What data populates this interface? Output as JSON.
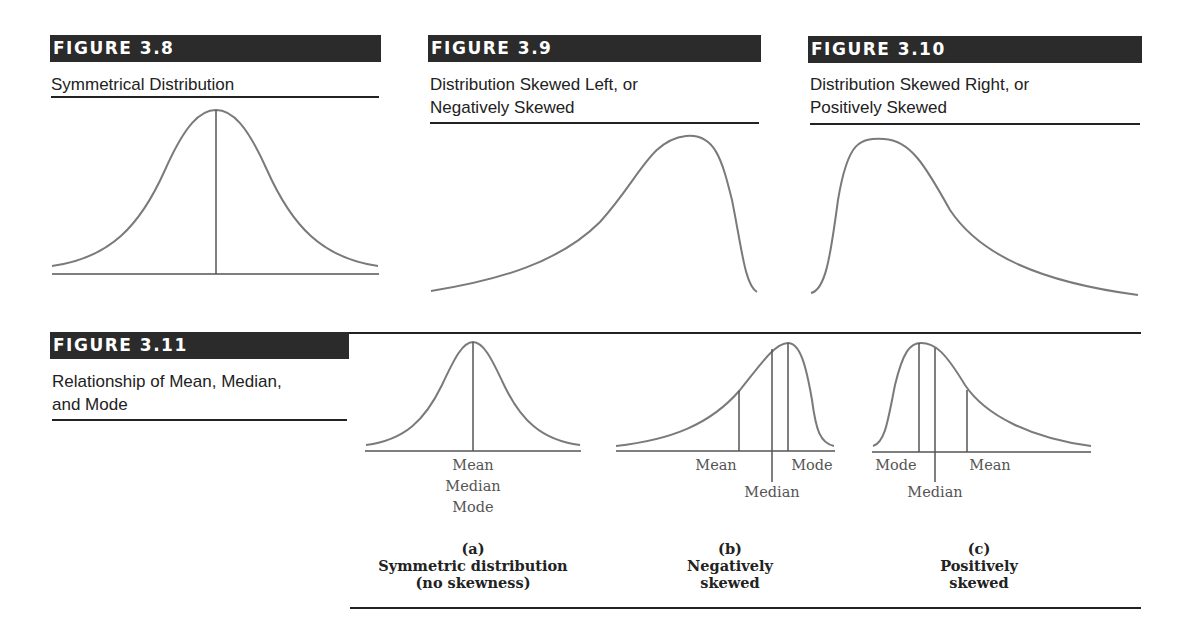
{
  "figures": [
    {
      "id": "fig-3-8",
      "label": "FIGURE 3.8",
      "subtitle_lines": [
        "Symmetrical Distribution"
      ]
    },
    {
      "id": "fig-3-9",
      "label": "FIGURE 3.9",
      "subtitle_lines": [
        "Distribution Skewed Left, or",
        "Negatively Skewed"
      ]
    },
    {
      "id": "fig-3-10",
      "label": "FIGURE 3.10",
      "subtitle_lines": [
        "Distribution Skewed Right, or",
        "Positively Skewed"
      ]
    },
    {
      "id": "fig-3-11",
      "label": "FIGURE 3.11",
      "subtitle_lines": [
        "Relationship of Mean, Median,",
        "and Mode"
      ],
      "panels": [
        {
          "letter": "(a)",
          "caption_lines": [
            "Symmetric distribution",
            "(no skewness)"
          ],
          "markers": [
            "Mean",
            "Median",
            "Mode"
          ]
        },
        {
          "letter": "(b)",
          "caption_lines": [
            "Negatively",
            "skewed"
          ],
          "markers": [
            "Mean",
            "Median",
            "Mode"
          ]
        },
        {
          "letter": "(c)",
          "caption_lines": [
            "Positively",
            "skewed"
          ],
          "markers": [
            "Mode",
            "Median",
            "Mean"
          ]
        }
      ]
    }
  ],
  "colors": {
    "header_bg": "#2b2b2b",
    "curve": "#7a7a7a",
    "rule": "#222222"
  }
}
